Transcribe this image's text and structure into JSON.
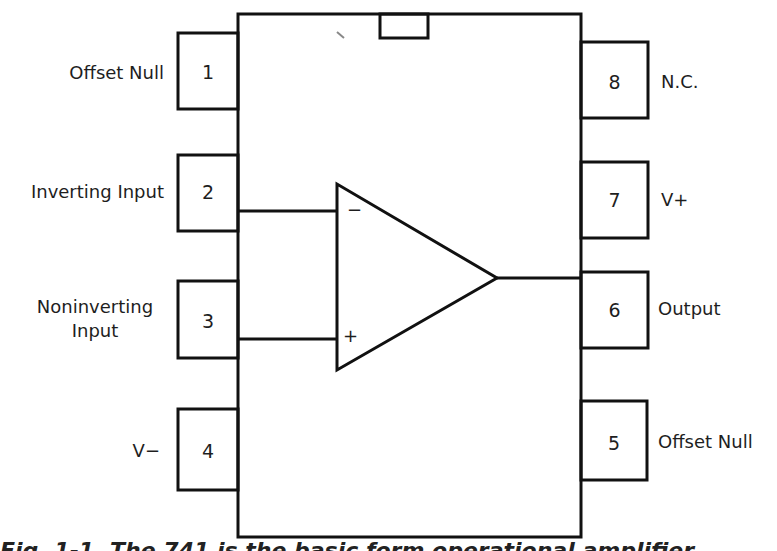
{
  "diagram": {
    "type": "IC pinout",
    "device": "8-pin op-amp (DIP)",
    "amplifier": {
      "inverting_sign": "−",
      "noninverting_sign": "+"
    },
    "pins_left": [
      {
        "number": "1",
        "label": "Offset Null"
      },
      {
        "number": "2",
        "label": "Inverting Input"
      },
      {
        "number": "3",
        "label_line1": "Noninverting",
        "label_line2": "Input"
      },
      {
        "number": "4",
        "label": "V−"
      }
    ],
    "pins_right": [
      {
        "number": "8",
        "label": "N.C."
      },
      {
        "number": "7",
        "label": "V+"
      },
      {
        "number": "6",
        "label": "Output"
      },
      {
        "number": "5",
        "label": "Offset Null"
      }
    ]
  },
  "caption": {
    "text": "Fig. 1-1. The 741 is the basic form operational amplifier"
  },
  "colors": {
    "line": "#111111",
    "background": "#ffffff"
  }
}
